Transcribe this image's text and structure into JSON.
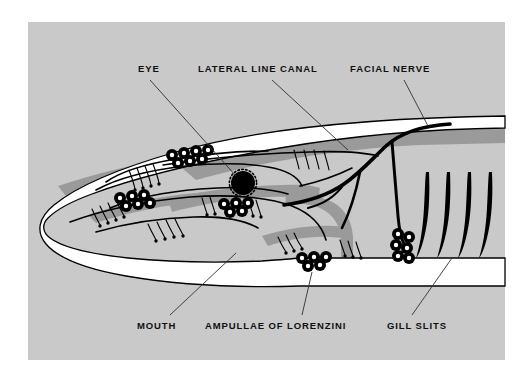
{
  "figure": {
    "panel_background_color": "#c9c9c9",
    "page_background_color": "#ffffff",
    "body_fill_color": "#ffffff",
    "shading_color": "#9a9a9a",
    "ink_color": "#000000"
  },
  "labels": {
    "eye": "EYE",
    "lateral_line_canal": "LATERAL LINE CANAL",
    "facial_nerve": "FACIAL NERVE",
    "mouth": "MOUTH",
    "ampullae_of_lorenzini": "AMPULLAE OF LORENZINI",
    "gill_slits": "GILL SLITS"
  },
  "features": {
    "gill_slit_count": 4,
    "ampullae_cluster_count": 5,
    "eye_description": "black filled circle with ringed pore border"
  }
}
